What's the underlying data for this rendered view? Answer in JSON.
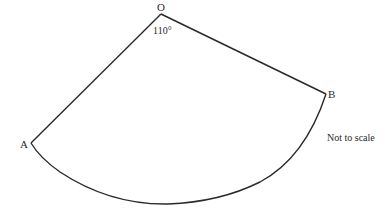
{
  "diagram": {
    "type": "sector",
    "points": {
      "O": {
        "label": "O",
        "x": 161,
        "y": 14
      },
      "A": {
        "label": "A",
        "x": 31,
        "y": 143
      },
      "B": {
        "label": "B",
        "x": 326,
        "y": 94
      }
    },
    "angle_label": "110°",
    "note": "Not to scale",
    "stroke_color": "#2a2a2a",
    "arc": {
      "rx": 183,
      "ry": 190
    }
  }
}
